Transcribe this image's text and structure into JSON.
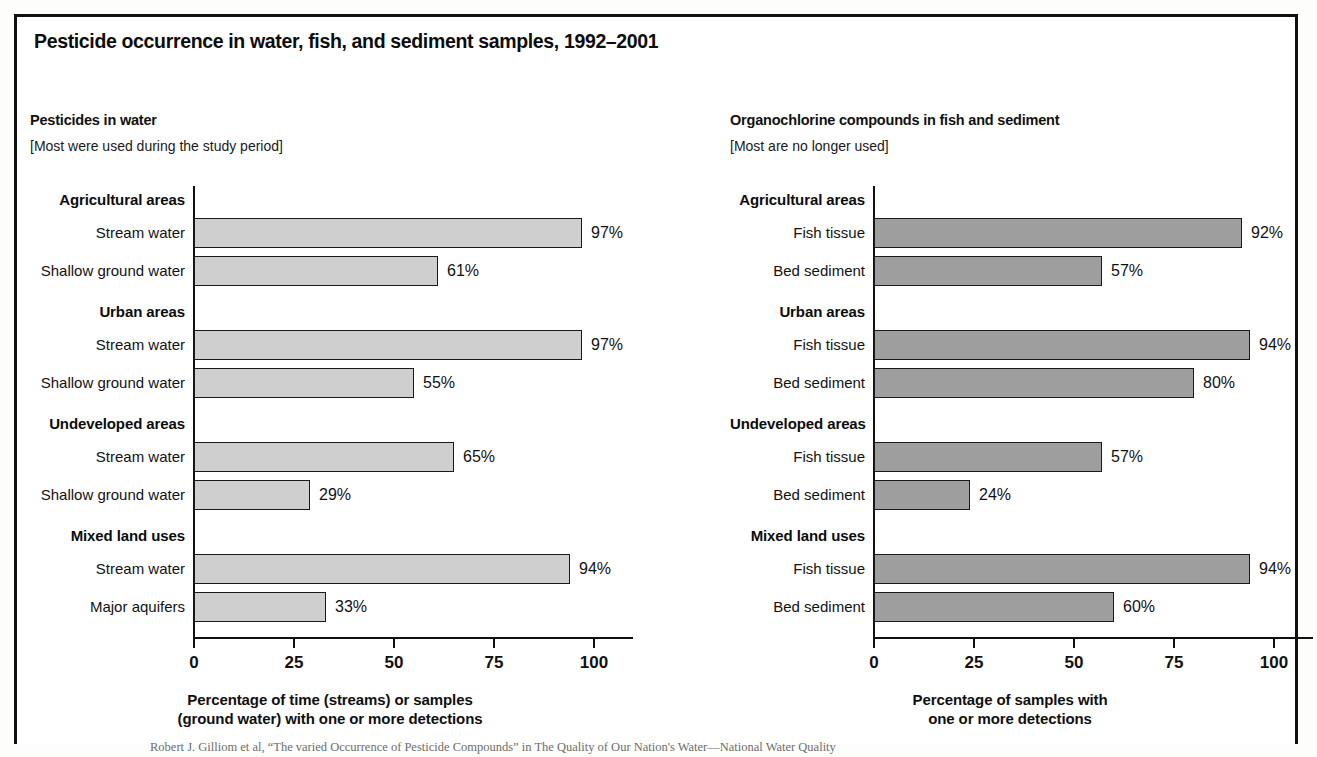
{
  "figure": {
    "title": "Pesticide occurrence in water, fish, and sediment samples, 1992–2001",
    "source_note": "Robert J. Gilliom et al, “The varied Occurrence of Pesticide Compounds” in The Quality of Our Nation's Water—National Water Quality"
  },
  "colors": {
    "bar_light": "#cfcfcf",
    "bar_dark": "#9e9e9e",
    "outline": "#1a1a1a",
    "text": "#111111"
  },
  "chart_data": [
    {
      "type": "bar",
      "orientation": "horizontal",
      "title": "Pesticides in water",
      "subtitle": "[Most were used during the study period]",
      "xlabel": "Percentage of time (streams) or samples (ground water) with one or more detections",
      "xlabel_lines": [
        "Percentage of time (streams) or samples",
        "(ground water) with one or more detections"
      ],
      "ylabel": "",
      "xlim": [
        0,
        110
      ],
      "xticks": [
        0,
        25,
        50,
        75,
        100
      ],
      "xticklabels": [
        "0",
        "25",
        "50",
        "75",
        "100"
      ],
      "grid": false,
      "legend": "none",
      "groups": [
        {
          "label": "Agricultural areas",
          "rows": [
            {
              "label": "Stream water",
              "value": 97,
              "value_label": "97%"
            },
            {
              "label": "Shallow ground water",
              "value": 61,
              "value_label": "61%"
            }
          ]
        },
        {
          "label": "Urban areas",
          "rows": [
            {
              "label": "Stream water",
              "value": 97,
              "value_label": "97%"
            },
            {
              "label": "Shallow ground water",
              "value": 55,
              "value_label": "55%"
            }
          ]
        },
        {
          "label": "Undeveloped areas",
          "rows": [
            {
              "label": "Stream water",
              "value": 65,
              "value_label": "65%"
            },
            {
              "label": "Shallow ground water",
              "value": 29,
              "value_label": "29%"
            }
          ]
        },
        {
          "label": "Mixed land uses",
          "rows": [
            {
              "label": "Stream water",
              "value": 94,
              "value_label": "94%"
            },
            {
              "label": "Major aquifers",
              "value": 33,
              "value_label": "33%"
            }
          ]
        }
      ],
      "categories": [
        "Agricultural areas - Stream water",
        "Agricultural areas - Shallow ground water",
        "Urban areas - Stream water",
        "Urban areas - Shallow ground water",
        "Undeveloped areas - Stream water",
        "Undeveloped areas - Shallow ground water",
        "Mixed land uses - Stream water",
        "Mixed land uses - Major aquifers"
      ],
      "values": [
        97,
        61,
        97,
        55,
        65,
        29,
        94,
        33
      ]
    },
    {
      "type": "bar",
      "orientation": "horizontal",
      "title": "Organochlorine compounds in fish and sediment",
      "subtitle": "[Most are no longer used]",
      "xlabel": "Percentage of samples with one or more detections",
      "xlabel_lines": [
        "Percentage of samples with",
        "one or more detections"
      ],
      "ylabel": "",
      "xlim": [
        0,
        110
      ],
      "xticks": [
        0,
        25,
        50,
        75,
        100
      ],
      "xticklabels": [
        "0",
        "25",
        "50",
        "75",
        "100"
      ],
      "grid": false,
      "legend": "none",
      "groups": [
        {
          "label": "Agricultural areas",
          "rows": [
            {
              "label": "Fish tissue",
              "value": 92,
              "value_label": "92%"
            },
            {
              "label": "Bed sediment",
              "value": 57,
              "value_label": "57%"
            }
          ]
        },
        {
          "label": "Urban areas",
          "rows": [
            {
              "label": "Fish tissue",
              "value": 94,
              "value_label": "94%"
            },
            {
              "label": "Bed sediment",
              "value": 80,
              "value_label": "80%"
            }
          ]
        },
        {
          "label": "Undeveloped areas",
          "rows": [
            {
              "label": "Fish tissue",
              "value": 57,
              "value_label": "57%"
            },
            {
              "label": "Bed sediment",
              "value": 24,
              "value_label": "24%"
            }
          ]
        },
        {
          "label": "Mixed land uses",
          "rows": [
            {
              "label": "Fish tissue",
              "value": 94,
              "value_label": "94%"
            },
            {
              "label": "Bed sediment",
              "value": 60,
              "value_label": "60%"
            }
          ]
        }
      ],
      "categories": [
        "Agricultural areas - Fish tissue",
        "Agricultural areas - Bed sediment",
        "Urban areas - Fish tissue",
        "Urban areas - Bed sediment",
        "Undeveloped areas - Fish tissue",
        "Undeveloped areas - Bed sediment",
        "Mixed land uses - Fish tissue",
        "Mixed land uses - Bed sediment"
      ],
      "values": [
        92,
        57,
        94,
        80,
        57,
        24,
        94,
        60
      ]
    }
  ]
}
